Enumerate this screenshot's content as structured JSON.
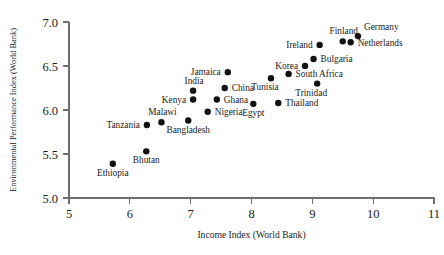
{
  "chart_data": {
    "type": "scatter",
    "title": "",
    "xlabel": "Income Index (World Bank)",
    "ylabel": "Environmental Performance Index (World Bank)",
    "xlim": [
      5,
      11
    ],
    "ylim": [
      5.0,
      7.0
    ],
    "xticks": [
      "5",
      "6",
      "7",
      "8",
      "9",
      "10",
      "11"
    ],
    "yticks": [
      "5.0",
      "5.5",
      "6.0",
      "6.5",
      "7.0"
    ],
    "grid": false,
    "legend": null,
    "marker_color": "#111111",
    "axis_color": "#6e6e6e",
    "points": [
      {
        "label": "Ethiopia",
        "x": 5.72,
        "y": 5.39,
        "label_pos": "below"
      },
      {
        "label": "Bhutan",
        "x": 6.27,
        "y": 5.53,
        "label_pos": "below"
      },
      {
        "label": "Tanzania",
        "x": 6.28,
        "y": 5.83,
        "label_pos": "left"
      },
      {
        "label": "Malawi",
        "x": 6.52,
        "y": 5.86,
        "label_pos": "above-left"
      },
      {
        "label": "Bangladesh",
        "x": 6.96,
        "y": 5.88,
        "label_pos": "below"
      },
      {
        "label": "Kenya",
        "x": 7.04,
        "y": 6.12,
        "label_pos": "left"
      },
      {
        "label": "India",
        "x": 7.04,
        "y": 6.22,
        "label_pos": "above-left"
      },
      {
        "label": "Nigeria",
        "x": 7.28,
        "y": 5.98,
        "label_pos": "right"
      },
      {
        "label": "Ghana",
        "x": 7.43,
        "y": 6.12,
        "label_pos": "right"
      },
      {
        "label": "China",
        "x": 7.56,
        "y": 6.25,
        "label_pos": "right"
      },
      {
        "label": "Jamaica",
        "x": 7.61,
        "y": 6.43,
        "label_pos": "left"
      },
      {
        "label": "Egypt",
        "x": 8.03,
        "y": 6.07,
        "label_pos": "below"
      },
      {
        "label": "Thailand",
        "x": 8.44,
        "y": 6.08,
        "label_pos": "right"
      },
      {
        "label": "Tunisia",
        "x": 8.32,
        "y": 6.36,
        "label_pos": "below-right"
      },
      {
        "label": "South Africa",
        "x": 8.61,
        "y": 6.41,
        "label_pos": "right"
      },
      {
        "label": "Korea",
        "x": 8.88,
        "y": 6.5,
        "label_pos": "left"
      },
      {
        "label": "Trinidad",
        "x": 9.08,
        "y": 6.3,
        "label_pos": "below-right"
      },
      {
        "label": "Bulgaria",
        "x": 9.02,
        "y": 6.58,
        "label_pos": "right"
      },
      {
        "label": "Ireland",
        "x": 9.12,
        "y": 6.74,
        "label_pos": "left"
      },
      {
        "label": "Finland",
        "x": 9.5,
        "y": 6.78,
        "label_pos": "above-left"
      },
      {
        "label": "Netherlands",
        "x": 9.63,
        "y": 6.77,
        "label_pos": "right"
      },
      {
        "label": "Germany",
        "x": 9.75,
        "y": 6.84,
        "label_pos": "above-right"
      }
    ]
  },
  "axes": {
    "x_title": "Income Index (World Bank)",
    "y_title": "Environmental Performance Index (World Bank)"
  }
}
